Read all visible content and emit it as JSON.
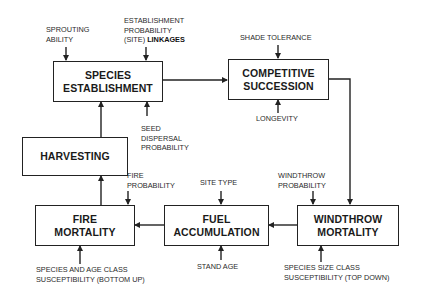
{
  "diagram": {
    "type": "flowchart",
    "colors": {
      "line": "#222222",
      "text": "#1a1a1a",
      "background": "#ffffff"
    },
    "boxes": {
      "species_establishment": {
        "line1": "SPECIES",
        "line2": "ESTABLISHMENT"
      },
      "competitive_succession": {
        "line1": "COMPETITIVE",
        "line2": "SUCCESSION"
      },
      "harvesting": {
        "line1": "HARVESTING"
      },
      "fire_mortality": {
        "line1": "FIRE",
        "line2": "MORTALITY"
      },
      "fuel_accumulation": {
        "line1": "FUEL",
        "line2": "ACCUMULATION"
      },
      "windthrow_mortality": {
        "line1": "WINDTHROW",
        "line2": "MORTALITY"
      }
    },
    "inputs": {
      "sprouting_ability": {
        "line1": "SPROUTING",
        "line2": "ABILITY"
      },
      "establishment_probability": {
        "line1": "ESTABLISHMENT",
        "line2": "PROBABILITY",
        "line3_plain": "(SITE)",
        "line3_bold": "LINKAGES"
      },
      "seed_dispersal": {
        "line1": "SEED",
        "line2": "DISPERSAL",
        "line3": "PROBABILITY"
      },
      "shade_tolerance": {
        "line1": "SHADE TOLERANCE"
      },
      "longevity": {
        "line1": "LONGEVITY"
      },
      "fire_probability": {
        "line1": "FIRE",
        "line2": "PROBABILITY"
      },
      "site_type": {
        "line1": "SITE TYPE"
      },
      "windthrow_probability": {
        "line1": "WINDTHROW",
        "line2": "PROBABILITY"
      },
      "species_age_class": {
        "line1": "SPECIES AND AGE CLASS",
        "line2": "SUSCEPTIBILITY (BOTTOM UP)"
      },
      "stand_age": {
        "line1": "STAND AGE"
      },
      "species_size_class": {
        "line1": "SPECIES SIZE CLASS",
        "line2": "SUSCEPTIBILITY (TOP DOWN)"
      }
    },
    "edges": [
      {
        "from": "SPECIES ESTABLISHMENT",
        "to": "COMPETITIVE SUCCESSION"
      },
      {
        "from": "COMPETITIVE SUCCESSION",
        "to": "WINDTHROW MORTALITY"
      },
      {
        "from": "WINDTHROW MORTALITY",
        "to": "FUEL ACCUMULATION"
      },
      {
        "from": "FUEL ACCUMULATION",
        "to": "FIRE MORTALITY"
      },
      {
        "from": "FIRE MORTALITY",
        "to": "HARVESTING"
      },
      {
        "from": "HARVESTING",
        "to": "SPECIES ESTABLISHMENT"
      },
      {
        "from": "SPROUTING ABILITY",
        "to": "SPECIES ESTABLISHMENT"
      },
      {
        "from": "ESTABLISHMENT PROBABILITY (SITE) LINKAGES",
        "to": "SPECIES ESTABLISHMENT"
      },
      {
        "from": "SEED DISPERSAL PROBABILITY",
        "to": "SPECIES ESTABLISHMENT"
      },
      {
        "from": "SHADE TOLERANCE",
        "to": "COMPETITIVE SUCCESSION"
      },
      {
        "from": "LONGEVITY",
        "to": "COMPETITIVE SUCCESSION"
      },
      {
        "from": "WINDTHROW PROBABILITY",
        "to": "WINDTHROW MORTALITY"
      },
      {
        "from": "SPECIES SIZE CLASS SUSCEPTIBILITY (TOP DOWN)",
        "to": "WINDTHROW MORTALITY"
      },
      {
        "from": "SITE TYPE",
        "to": "FUEL ACCUMULATION"
      },
      {
        "from": "STAND AGE",
        "to": "FUEL ACCUMULATION"
      },
      {
        "from": "FIRE PROBABILITY",
        "to": "FIRE MORTALITY"
      },
      {
        "from": "SPECIES AND AGE CLASS SUSCEPTIBILITY (BOTTOM UP)",
        "to": "FIRE MORTALITY"
      }
    ]
  }
}
